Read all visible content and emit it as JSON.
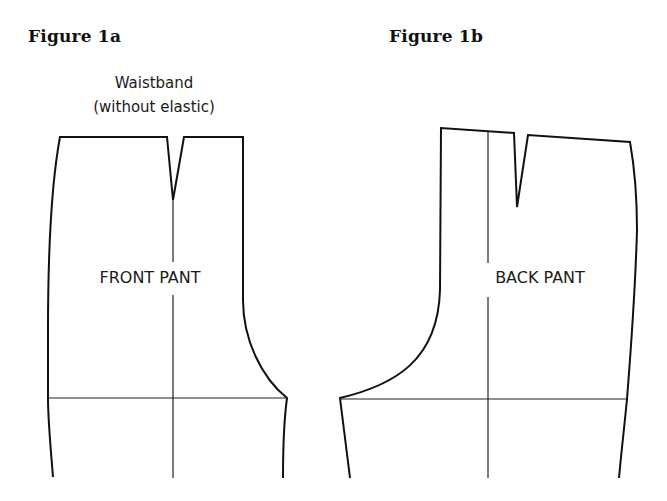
{
  "figures": [
    {
      "id": "1a",
      "title": "Figure 1a",
      "annotation_line1": "Waistband",
      "annotation_line2": "(without elastic)",
      "piece_label": "FRONT PANT"
    },
    {
      "id": "1b",
      "title": "Figure 1b",
      "piece_label": "BACK PANT"
    }
  ]
}
